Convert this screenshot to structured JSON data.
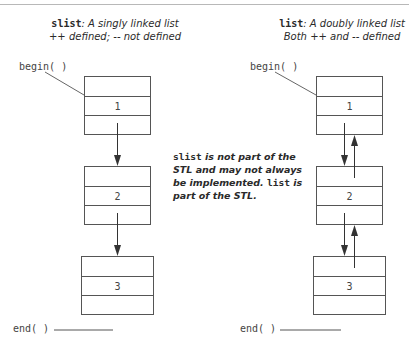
{
  "left": {
    "caption_code": "slist",
    "caption_line1": ": A singly linked list",
    "caption_line2": "++ defined; -- not defined",
    "begin_label": "begin( )",
    "end_label": "end( )",
    "nodes": [
      {
        "value": "1"
      },
      {
        "value": "2"
      },
      {
        "value": "3"
      }
    ]
  },
  "right": {
    "caption_code": "list",
    "caption_line1": ": A doubly linked list",
    "caption_line2": "Both ++ and -- defined",
    "begin_label": "begin( )",
    "end_label": "end( )",
    "nodes": [
      {
        "value": "1"
      },
      {
        "value": "2"
      },
      {
        "value": "3"
      }
    ]
  },
  "note": {
    "part1_code": "slist",
    "part2": " is not part of the STL and may not always be implemented. ",
    "part3_code": "list",
    "part4": " is part of the STL."
  },
  "colors": {
    "line": "#555555",
    "text": "#333333",
    "rule": "#b8b8b8"
  }
}
